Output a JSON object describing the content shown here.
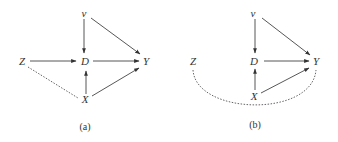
{
  "panels": [
    {
      "caption": "(a)",
      "nodes": {
        "v": "v",
        "D": "D",
        "Y": "Y",
        "Z": "Z",
        "X": "X"
      },
      "edges": [
        {
          "from": "v",
          "to": "D",
          "type": "directed"
        },
        {
          "from": "v",
          "to": "Y",
          "type": "directed"
        },
        {
          "from": "Z",
          "to": "D",
          "type": "directed"
        },
        {
          "from": "D",
          "to": "Y",
          "type": "directed"
        },
        {
          "from": "X",
          "to": "D",
          "type": "directed"
        },
        {
          "from": "X",
          "to": "Y",
          "type": "directed"
        },
        {
          "from": "Z",
          "to": "X",
          "type": "dotted-undirected"
        }
      ]
    },
    {
      "caption": "(b)",
      "nodes": {
        "v": "v",
        "D": "D",
        "Y": "Y",
        "Z": "Z",
        "X": "X"
      },
      "edges": [
        {
          "from": "v",
          "to": "D",
          "type": "directed"
        },
        {
          "from": "v",
          "to": "Y",
          "type": "directed"
        },
        {
          "from": "D",
          "to": "Y",
          "type": "directed"
        },
        {
          "from": "X",
          "to": "D",
          "type": "directed"
        },
        {
          "from": "X",
          "to": "Y",
          "type": "directed"
        },
        {
          "from": "Z",
          "to": "Y",
          "type": "dotted-curved-undirected"
        }
      ]
    }
  ]
}
